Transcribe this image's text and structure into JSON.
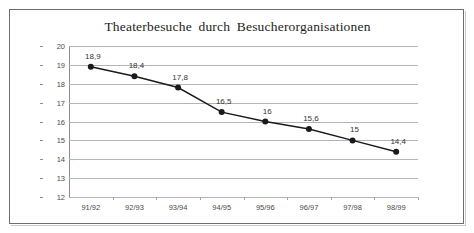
{
  "chart_data": {
    "type": "line",
    "title": "Theaterbesuche  durch  Besucherorganisationen",
    "xlabel": "",
    "ylabel": "",
    "categories": [
      "91/92",
      "92/93",
      "93/94",
      "94/95",
      "95/96",
      "96/97",
      "97/98",
      "98/99"
    ],
    "values": [
      18.9,
      18.4,
      17.8,
      16.5,
      16.0,
      15.6,
      15.0,
      14.4
    ],
    "point_labels": [
      "18,9",
      "18,4",
      "17,8",
      "16,5",
      "16",
      "15,6",
      "15",
      "14,4"
    ],
    "ylim": [
      12,
      20
    ],
    "ytick_values": [
      20,
      19,
      18,
      17,
      16,
      15,
      14,
      13,
      12
    ],
    "ytick_labels": [
      "20",
      "19",
      "18",
      "17",
      "16",
      "15",
      "14",
      "13",
      "12"
    ],
    "grid": true,
    "legend": false,
    "legend_position": "none",
    "series_color": "#1a1a1a",
    "marker": "circle",
    "gridline_color": "#b4b4b4",
    "axis_color": "#8d8d8d",
    "background_color": "#ffffff",
    "border_color": "#6e6e6e"
  }
}
